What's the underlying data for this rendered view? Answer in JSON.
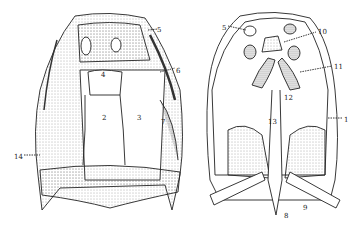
{
  "figure": {
    "left_view": {
      "name": "skull-dorsal-view",
      "labels": [
        {
          "text": "4",
          "x": 101,
          "y": 72
        },
        {
          "text": "2",
          "x": 102,
          "y": 115
        },
        {
          "text": "3",
          "x": 137,
          "y": 115
        },
        {
          "text": "7",
          "x": 161,
          "y": 119
        },
        {
          "text": "5",
          "x": 157,
          "y": 27
        },
        {
          "text": "6",
          "x": 176,
          "y": 68
        },
        {
          "text": "14",
          "x": 14,
          "y": 154
        }
      ]
    },
    "right_view": {
      "name": "skull-ventral-view",
      "labels": [
        {
          "text": "5",
          "x": 222,
          "y": 25
        },
        {
          "text": "10",
          "x": 318,
          "y": 29
        },
        {
          "text": "11",
          "x": 334,
          "y": 64
        },
        {
          "text": "12",
          "x": 284,
          "y": 95
        },
        {
          "text": "13",
          "x": 268,
          "y": 119
        },
        {
          "text": "1",
          "x": 344,
          "y": 117
        },
        {
          "text": "9",
          "x": 303,
          "y": 205
        },
        {
          "text": "8",
          "x": 284,
          "y": 213
        }
      ]
    }
  }
}
